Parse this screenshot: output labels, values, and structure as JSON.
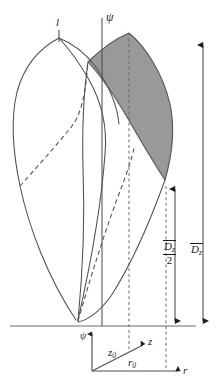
{
  "figure": {
    "type": "technical-line-diagram",
    "background_color": "#ffffff",
    "line_color": "#4f4f4f",
    "text_color": "#1d1d1d",
    "shaded_region_fill": "#999999",
    "shaded_region_stroke": "#555555",
    "dashed_line_color": "#4f4f4f"
  },
  "labels": {
    "psi_axis_top": "ψ",
    "psi_axis_bottom": "ψ",
    "lobe_marker": "l",
    "z_axis": "z",
    "r_axis": "r",
    "z_offset": "z",
    "z_offset_sub": "0",
    "r_offset": "r",
    "r_offset_sub": "0",
    "dim_half": {
      "numerator_symbol": "D",
      "numerator_sub": "z",
      "denominator": "2",
      "overbar": true
    },
    "dim_full": {
      "symbol": "D",
      "sub": "z",
      "overbar": true
    }
  },
  "elements": {
    "baseline_name": "ground-baseline",
    "vertical_axis_name": "psi-axis",
    "shaded_lobe_name": "shaded-cross-section",
    "left_lobe_name": "left-lobe-outline",
    "right_lobe_name": "right-lobe-outline",
    "dashed_curve_name": "hidden-edge-dashed-curve",
    "dim_half_name": "half-diameter-dimension",
    "dim_full_name": "full-diameter-dimension"
  }
}
